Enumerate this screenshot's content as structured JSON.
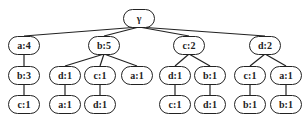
{
  "tree": {
    "nodes": [
      {
        "id": "root",
        "label": "γ",
        "x": 139,
        "y": 18
      },
      {
        "id": "a4",
        "label": "a:4",
        "x": 24,
        "y": 45
      },
      {
        "id": "b5",
        "label": "b:5",
        "x": 104,
        "y": 45
      },
      {
        "id": "c2",
        "label": "c:2",
        "x": 189,
        "y": 45
      },
      {
        "id": "d2",
        "label": "d:2",
        "x": 265,
        "y": 45
      },
      {
        "id": "b3",
        "label": "b:3",
        "x": 24,
        "y": 75
      },
      {
        "id": "d1a",
        "label": "d:1",
        "x": 65,
        "y": 75
      },
      {
        "id": "c1a",
        "label": "c:1",
        "x": 100,
        "y": 75
      },
      {
        "id": "a1a",
        "label": "a:1",
        "x": 137,
        "y": 75
      },
      {
        "id": "d1b",
        "label": "d:1",
        "x": 175,
        "y": 75
      },
      {
        "id": "b1a",
        "label": "b:1",
        "x": 210,
        "y": 75
      },
      {
        "id": "c1b",
        "label": "c:1",
        "x": 250,
        "y": 75
      },
      {
        "id": "a1b",
        "label": "a:1",
        "x": 286,
        "y": 75
      },
      {
        "id": "c1c",
        "label": "c:1",
        "x": 24,
        "y": 104
      },
      {
        "id": "a1c",
        "label": "a:1",
        "x": 65,
        "y": 104
      },
      {
        "id": "d1c",
        "label": "d:1",
        "x": 100,
        "y": 104
      },
      {
        "id": "c1d",
        "label": "c:1",
        "x": 175,
        "y": 104
      },
      {
        "id": "d1d",
        "label": "d:1",
        "x": 210,
        "y": 104
      },
      {
        "id": "b1b",
        "label": "b:1",
        "x": 250,
        "y": 104
      },
      {
        "id": "b1c",
        "label": "b:1",
        "x": 286,
        "y": 104
      }
    ],
    "edges": [
      [
        "root",
        "a4"
      ],
      [
        "root",
        "b5"
      ],
      [
        "root",
        "c2"
      ],
      [
        "root",
        "d2"
      ],
      [
        "a4",
        "b3"
      ],
      [
        "b3",
        "c1c"
      ],
      [
        "b5",
        "d1a"
      ],
      [
        "b5",
        "c1a"
      ],
      [
        "b5",
        "a1a"
      ],
      [
        "d1a",
        "a1c"
      ],
      [
        "c1a",
        "d1c"
      ],
      [
        "c2",
        "d1b"
      ],
      [
        "c2",
        "b1a"
      ],
      [
        "d1b",
        "c1d"
      ],
      [
        "b1a",
        "d1d"
      ],
      [
        "d2",
        "c1b"
      ],
      [
        "d2",
        "a1b"
      ],
      [
        "c1b",
        "b1b"
      ],
      [
        "a1b",
        "b1c"
      ]
    ]
  }
}
